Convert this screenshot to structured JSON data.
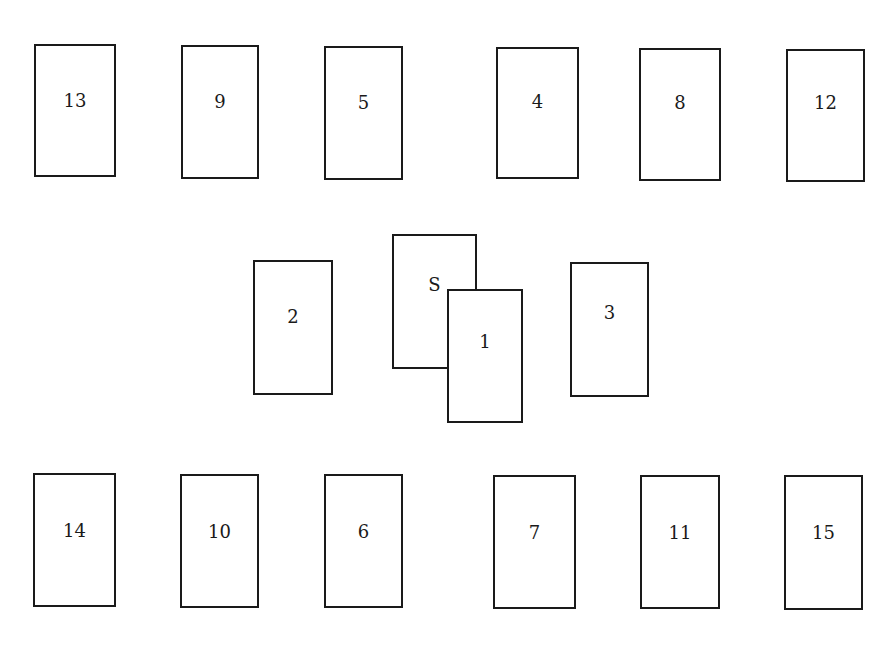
{
  "diagram": {
    "title": "",
    "cards": [
      {
        "label": "13",
        "x": 34,
        "y": 44,
        "w": 82,
        "h": 133,
        "ly": 56
      },
      {
        "label": "9",
        "x": 181,
        "y": 45,
        "w": 78,
        "h": 134,
        "ly": 56
      },
      {
        "label": "5",
        "x": 324,
        "y": 46,
        "w": 79,
        "h": 134,
        "ly": 56
      },
      {
        "label": "4",
        "x": 496,
        "y": 47,
        "w": 83,
        "h": 132,
        "ly": 54
      },
      {
        "label": "8",
        "x": 639,
        "y": 48,
        "w": 82,
        "h": 133,
        "ly": 54
      },
      {
        "label": "12",
        "x": 786,
        "y": 49,
        "w": 79,
        "h": 133,
        "ly": 53
      },
      {
        "label": "2",
        "x": 253,
        "y": 260,
        "w": 80,
        "h": 135,
        "ly": 56
      },
      {
        "label": "S",
        "x": 392,
        "y": 234,
        "w": 85,
        "h": 135,
        "ly": 50
      },
      {
        "label": "1",
        "x": 447,
        "y": 289,
        "w": 76,
        "h": 134,
        "ly": 52
      },
      {
        "label": "3",
        "x": 570,
        "y": 262,
        "w": 79,
        "h": 135,
        "ly": 50
      },
      {
        "label": "14",
        "x": 33,
        "y": 473,
        "w": 83,
        "h": 134,
        "ly": 57
      },
      {
        "label": "10",
        "x": 180,
        "y": 474,
        "w": 79,
        "h": 134,
        "ly": 57
      },
      {
        "label": "6",
        "x": 324,
        "y": 474,
        "w": 79,
        "h": 134,
        "ly": 57
      },
      {
        "label": "7",
        "x": 493,
        "y": 475,
        "w": 83,
        "h": 134,
        "ly": 57
      },
      {
        "label": "11",
        "x": 640,
        "y": 475,
        "w": 80,
        "h": 134,
        "ly": 57
      },
      {
        "label": "15",
        "x": 784,
        "y": 475,
        "w": 79,
        "h": 135,
        "ly": 57
      }
    ]
  }
}
